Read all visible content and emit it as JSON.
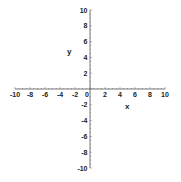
{
  "chart_data": {
    "type": "line",
    "title": "",
    "xlabel": "x",
    "ylabel": "y",
    "xlim": [
      -10,
      10
    ],
    "ylim": [
      -10,
      10
    ],
    "grid": false,
    "legend": null,
    "x_ticks": [
      -10,
      -8,
      -6,
      -4,
      -2,
      2,
      4,
      6,
      8,
      10
    ],
    "y_ticks": [
      10,
      8,
      6,
      4,
      2,
      -2,
      -4,
      -6,
      -8,
      -10
    ],
    "origin_label": "0",
    "series": [],
    "x_tick_labels": [
      "-10",
      "-8",
      "-6",
      "-4",
      "-2",
      "2",
      "4",
      "6",
      "8",
      "10"
    ],
    "y_tick_labels": [
      "10",
      "8",
      "6",
      "4",
      "2",
      "-2",
      "-4",
      "-6",
      "-8",
      "-10"
    ]
  },
  "colors": {
    "axis": "#555555",
    "text": "#222222",
    "background": "#ffffff"
  },
  "layout": {
    "origin_px": [
      90,
      89
    ],
    "x_unit_px": 7.5,
    "y_unit_px": 7.9
  }
}
